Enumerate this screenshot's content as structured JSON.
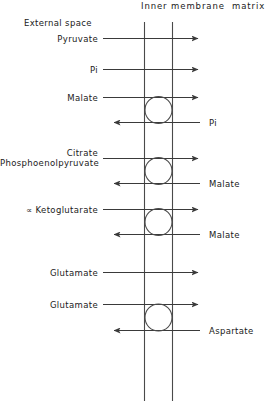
{
  "figure": {
    "type": "diagram",
    "headers": {
      "external": "External space",
      "membrane": "Inner membrane",
      "matrix": "matrix"
    },
    "transporters": [
      {
        "id": "pyruvate-carrier",
        "has_circle": false,
        "inward": {
          "label": "Pyruvate",
          "side": "external"
        },
        "outward": null
      },
      {
        "id": "phosphate-carrier",
        "has_circle": false,
        "inward": {
          "label": "Pi",
          "side": "external"
        },
        "outward": null
      },
      {
        "id": "dicarboxylate-carrier",
        "has_circle": true,
        "inward": {
          "label": "Malate",
          "side": "external"
        },
        "outward": {
          "label": "Pi",
          "side": "matrix"
        }
      },
      {
        "id": "tricarboxylate-carrier",
        "has_circle": true,
        "inward": {
          "label": "Citrate",
          "label2": "Phosphoenolpyruvate",
          "side": "external"
        },
        "outward": {
          "label": "Malate",
          "side": "matrix"
        }
      },
      {
        "id": "oxoglutarate-carrier",
        "has_circle": true,
        "inward": {
          "label": "∝ Ketoglutarate",
          "side": "external"
        },
        "outward": {
          "label": "Malate",
          "side": "matrix"
        }
      },
      {
        "id": "glutamate-carrier",
        "has_circle": false,
        "inward": {
          "label": "Glutamate",
          "side": "external"
        },
        "outward": null
      },
      {
        "id": "glutamate-aspartate-carrier",
        "has_circle": true,
        "inward": {
          "label": "Glutamate",
          "side": "external"
        },
        "outward": {
          "label": "Aspartate",
          "side": "matrix"
        }
      }
    ],
    "colors": {
      "stroke": "#3a3a3a",
      "text": "#1a1a1a",
      "background": "#ffffff"
    }
  }
}
